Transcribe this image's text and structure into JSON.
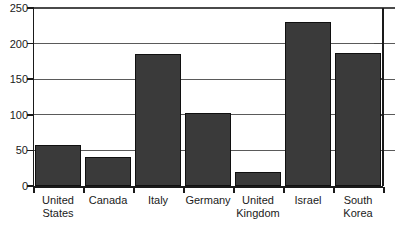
{
  "chart_data": {
    "type": "bar",
    "title": "",
    "subtitle": "",
    "xlabel": "",
    "ylabel": "",
    "categories": [
      "United States",
      "Canada",
      "Italy",
      "Germany",
      "United Kingdom",
      "Israel",
      "South Korea"
    ],
    "values": [
      57,
      41,
      185,
      103,
      20,
      231,
      187
    ],
    "ylim": [
      0,
      250
    ],
    "yticks": [
      0,
      50,
      100,
      150,
      200,
      250
    ],
    "ytick_labels": [
      "0",
      "50",
      "100",
      "150",
      "200",
      "250"
    ],
    "grid": true,
    "grid_axis": "y",
    "legend": null,
    "bar_color": "#3a3a3a",
    "bar_edge_color": "#101010",
    "axis_color": "#1a1a1a",
    "gridline_color": "#5a5a5a",
    "background": "#ffffff"
  }
}
